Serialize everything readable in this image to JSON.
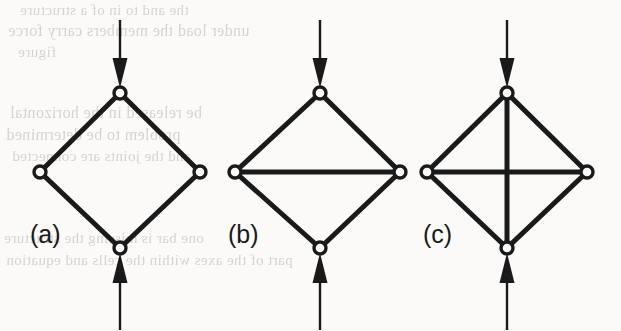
{
  "figure": {
    "type": "engineering-diagram",
    "canvas": {
      "width": 621,
      "height": 331,
      "background": "#fbfaf8"
    },
    "ink_color": "#1a1a1a",
    "joint_fill": "#fbfaf8",
    "panels": [
      {
        "id": "a",
        "label": "(a)",
        "label_position": {
          "x": 30,
          "y": 222
        },
        "center_x": 120,
        "description": "four-bar rhombus, unstable mechanism",
        "joints": [
          {
            "name": "top",
            "x": 120,
            "y": 93
          },
          {
            "name": "left",
            "x": 40,
            "y": 172
          },
          {
            "name": "right",
            "x": 200,
            "y": 172
          },
          {
            "name": "bottom",
            "x": 120,
            "y": 248
          }
        ],
        "members": [
          [
            "top",
            "left"
          ],
          [
            "top",
            "right"
          ],
          [
            "left",
            "bottom"
          ],
          [
            "right",
            "bottom"
          ]
        ],
        "loads": [
          {
            "name": "top-load",
            "direction": "down",
            "x": 120,
            "tail_y": 20,
            "head_y": 88
          },
          {
            "name": "bottom-load",
            "direction": "up",
            "x": 120,
            "tail_y": 330,
            "head_y": 253
          }
        ]
      },
      {
        "id": "b",
        "label": "(b)",
        "label_position": {
          "x": 228,
          "y": 222
        },
        "center_x": 320,
        "description": "rhombus with one horizontal diagonal, statically determinate",
        "joints": [
          {
            "name": "top",
            "x": 320,
            "y": 93
          },
          {
            "name": "left",
            "x": 235,
            "y": 172
          },
          {
            "name": "right",
            "x": 400,
            "y": 172
          },
          {
            "name": "bottom",
            "x": 320,
            "y": 248
          }
        ],
        "members": [
          [
            "top",
            "left"
          ],
          [
            "top",
            "right"
          ],
          [
            "left",
            "bottom"
          ],
          [
            "right",
            "bottom"
          ],
          [
            "left",
            "right"
          ]
        ],
        "loads": [
          {
            "name": "top-load",
            "direction": "down",
            "x": 320,
            "tail_y": 20,
            "head_y": 88
          },
          {
            "name": "bottom-load",
            "direction": "up",
            "x": 320,
            "tail_y": 330,
            "head_y": 253
          }
        ]
      },
      {
        "id": "c",
        "label": "(c)",
        "label_position": {
          "x": 423,
          "y": 222
        },
        "center_x": 507,
        "description": "rhombus with both diagonals, statically indeterminate",
        "joints": [
          {
            "name": "top",
            "x": 507,
            "y": 93
          },
          {
            "name": "left",
            "x": 427,
            "y": 172
          },
          {
            "name": "right",
            "x": 587,
            "y": 172
          },
          {
            "name": "bottom",
            "x": 507,
            "y": 248
          }
        ],
        "members": [
          [
            "top",
            "left"
          ],
          [
            "top",
            "right"
          ],
          [
            "left",
            "bottom"
          ],
          [
            "right",
            "bottom"
          ],
          [
            "left",
            "right"
          ],
          [
            "top",
            "bottom"
          ]
        ],
        "loads": [
          {
            "name": "top-load",
            "direction": "down",
            "x": 507,
            "tail_y": 20,
            "head_y": 88
          },
          {
            "name": "bottom-load",
            "direction": "up",
            "x": 507,
            "tail_y": 330,
            "head_y": 253
          }
        ]
      }
    ],
    "geometry": {
      "member_stroke_width": 5,
      "joint_radius_outer": 6,
      "joint_radius_inner": 2.6,
      "arrow_shaft_width": 2.4,
      "arrow_head_width": 15,
      "arrow_head_length": 30
    },
    "bleed_through": [
      {
        "text": "the and to in of a structure",
        "x": 20,
        "y": 2,
        "size": 15
      },
      {
        "text": "under load the members carry force",
        "x": 8,
        "y": 22,
        "size": 16
      },
      {
        "text": "figure",
        "x": 18,
        "y": 44,
        "size": 15
      },
      {
        "text": "be released in the horizontal",
        "x": 10,
        "y": 104,
        "size": 16
      },
      {
        "text": "problem to be determined",
        "x": 6,
        "y": 126,
        "size": 16
      },
      {
        "text": "and the joints are connected",
        "x": 12,
        "y": 148,
        "size": 15
      },
      {
        "text": "one bar is missing the structure",
        "x": 4,
        "y": 230,
        "size": 15
      },
      {
        "text": "part of the axes within the cells and equation",
        "x": 6,
        "y": 252,
        "size": 15
      }
    ]
  }
}
